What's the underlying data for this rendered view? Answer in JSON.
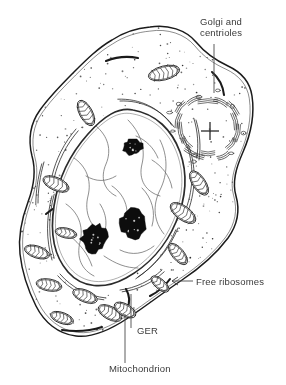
{
  "figure": {
    "style": "hand-drawn black-and-white line illustration with stippled cytoplasm",
    "background_color": "#ffffff",
    "ink_color": "#1b1b1b",
    "label_color": "#3a3a3a"
  },
  "labels": [
    {
      "id": "golgi",
      "name": "golgi-and-centrioles",
      "line1": "Golgi and",
      "line2": "centrioles",
      "text_x": 200,
      "text_y": 25,
      "leader": "M 214 44 L 214 93",
      "has_arrowhead": false
    },
    {
      "id": "ribosomes",
      "name": "free-ribosomes",
      "line1": "Free ribosomes",
      "line2": "",
      "text_x": 196,
      "text_y": 285,
      "leader": "M 193 281 L 172 281",
      "has_arrowhead": true
    },
    {
      "id": "ger",
      "name": "ger",
      "line1": "GER",
      "line2": "",
      "text_x": 137,
      "text_y": 334,
      "leader": "M 131 328 L 131 294",
      "has_arrowhead": false
    },
    {
      "id": "mitochondrion",
      "name": "mitochondrion",
      "line1": "Mitochondrion",
      "line2": "",
      "text_x": 109,
      "text_y": 372,
      "leader": "M 125 363 L 125 314",
      "has_arrowhead": false
    }
  ],
  "structures": {
    "cell_membrane": {
      "name": "plasma-membrane",
      "description": "irregular lobed outline enclosing the whole cell",
      "path": "M 150 27 C 168 24 186 30 196 42 C 206 54 215 60 228 66 C 241 72 250 82 252 96 C 255 116 250 136 243 152 C 236 168 232 182 236 196 C 240 210 238 224 228 238 C 216 254 200 268 182 280 C 164 292 146 306 128 318 C 110 330 92 338 76 336 C 58 334 44 322 36 306 C 28 290 22 272 20 254 C 18 236 22 218 28 202 C 34 186 36 170 32 156 C 28 140 30 124 40 110 C 50 96 62 84 74 72 C 86 60 98 48 112 40 C 124 32 138 28 150 27 Z"
    },
    "nucleus": {
      "name": "nucleus",
      "description": "large pale oval nucleus tilted diagonally, bounded by a thick double nuclear envelope",
      "envelope_path": "M 133 110 C 156 114 172 130 180 152 C 188 174 186 198 176 222 C 166 246 148 266 126 278 C 104 290 82 288 68 272 C 54 256 50 232 54 206 C 58 180 70 154 88 134 C 104 116 118 107 133 110 Z",
      "nucleoli": [
        {
          "name": "nucleolus-upper",
          "cx": 133,
          "cy": 147,
          "rx": 9.5,
          "ry": 8.0,
          "rot": -20
        },
        {
          "name": "nucleolus-lower-left",
          "cx": 94,
          "cy": 238,
          "rx": 12.5,
          "ry": 14.5,
          "rot": 15
        },
        {
          "name": "nucleolus-lower-right",
          "cx": 133,
          "cy": 224,
          "rx": 13.0,
          "ry": 15.0,
          "rot": -15
        }
      ]
    },
    "golgi": {
      "name": "golgi-apparatus",
      "description": "ring of stacked curved cisternae surrounding the centriole pair",
      "center_x": 208,
      "center_y": 127,
      "radius": 31,
      "cisterna_count": 14
    },
    "centrioles": {
      "name": "centriole-pair",
      "description": "pair of centrioles drawn as a cross at right angles",
      "center_x": 210,
      "center_y": 131,
      "arm_length": 9
    },
    "mitochondria": {
      "name": "mitochondria",
      "description": "elongated ovals containing zigzag cristae, scattered through the cytoplasm",
      "count": 14,
      "items": [
        {
          "cx": 164,
          "cy": 73,
          "rx": 16,
          "ry": 7.0,
          "rot": -14
        },
        {
          "cx": 86,
          "cy": 113,
          "rx": 14,
          "ry": 6.5,
          "rot": 62
        },
        {
          "cx": 56,
          "cy": 184,
          "rx": 14,
          "ry": 6.5,
          "rot": 24
        },
        {
          "cx": 199,
          "cy": 183,
          "rx": 14,
          "ry": 6.5,
          "rot": 56
        },
        {
          "cx": 183,
          "cy": 213,
          "rx": 15,
          "ry": 7.0,
          "rot": 36
        },
        {
          "cx": 178,
          "cy": 254,
          "rx": 13,
          "ry": 6.0,
          "rot": 50
        },
        {
          "cx": 37,
          "cy": 252,
          "rx": 13,
          "ry": 6.0,
          "rot": 18
        },
        {
          "cx": 49,
          "cy": 285,
          "rx": 13,
          "ry": 6.0,
          "rot": 10
        },
        {
          "cx": 85,
          "cy": 296,
          "rx": 13,
          "ry": 6.0,
          "rot": 22
        },
        {
          "cx": 62,
          "cy": 318,
          "rx": 12,
          "ry": 5.5,
          "rot": 20
        },
        {
          "cx": 110,
          "cy": 313,
          "rx": 13,
          "ry": 6.5,
          "rot": 28
        },
        {
          "cx": 125,
          "cy": 310,
          "rx": 12,
          "ry": 6.0,
          "rot": 30
        },
        {
          "cx": 66,
          "cy": 233,
          "rx": 11,
          "ry": 5.0,
          "rot": 12
        },
        {
          "cx": 160,
          "cy": 284,
          "rx": 11,
          "ry": 5.0,
          "rot": 40
        }
      ]
    },
    "ger": {
      "name": "granular-endoplasmic-reticulum",
      "description": "long curved cisternae of rough ER, drawn as paired parallel lines, mostly concentric with the nuclear envelope",
      "cisterna_count": 9
    },
    "free_ribosomes": {
      "name": "free-ribosomes",
      "description": "dense stipple of fine dots filling the cytoplasm",
      "dot_count": 620,
      "dot_radius": 0.62
    }
  }
}
